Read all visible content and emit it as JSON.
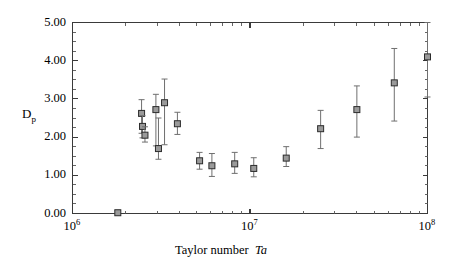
{
  "chart_data": {
    "type": "scatter",
    "title": "",
    "subtitle": "",
    "xlabel": "Taylor number Ta",
    "xlabel_plain": "Taylor number",
    "xlabel_italic": "Ta",
    "ylabel": "Dp",
    "ylabel_main": "D",
    "ylabel_sub": "p",
    "xscale": "log",
    "yscale": "linear",
    "xlim": [
      1000000,
      100000000
    ],
    "ylim": [
      0.0,
      5.0
    ],
    "grid": false,
    "legend": null,
    "legend_position": "none",
    "xticks_major": [
      1000000,
      10000000,
      100000000
    ],
    "xtick_labels": [
      "10⁶",
      "10⁷",
      "10⁸"
    ],
    "xtick_label_bases": [
      "10",
      "10",
      "10"
    ],
    "xtick_label_exponents": [
      "6",
      "7",
      "8"
    ],
    "yticks_major": [
      0.0,
      1.0,
      2.0,
      3.0,
      4.0,
      5.0
    ],
    "ytick_labels": [
      "0.00",
      "1.00",
      "2.00",
      "3.00",
      "4.00",
      "5.00"
    ],
    "ytick_minor_step": 0.25,
    "marker_style": "open-square",
    "marker_fill": "#9a9a9a",
    "marker_edge": "#2c2c2c",
    "errorbar_color": "#6f6f6f",
    "axis_color": "#3a3a3a",
    "series": [
      {
        "name": "Dp vs Taylor number",
        "points": [
          {
            "x": 1800000,
            "y": 0.02,
            "yerr_low": 0.02,
            "yerr_high": 0.06
          },
          {
            "x": 2450000,
            "y": 2.62,
            "yerr_low": 0.52,
            "yerr_high": 0.36
          },
          {
            "x": 2480000,
            "y": 2.28,
            "yerr_low": 0.3,
            "yerr_high": 0.28
          },
          {
            "x": 2560000,
            "y": 2.05,
            "yerr_low": 0.18,
            "yerr_high": 0.22
          },
          {
            "x": 2950000,
            "y": 2.72,
            "yerr_low": 0.95,
            "yerr_high": 0.4
          },
          {
            "x": 3050000,
            "y": 1.7,
            "yerr_low": 0.28,
            "yerr_high": 0.8
          },
          {
            "x": 3300000,
            "y": 2.9,
            "yerr_low": 1.1,
            "yerr_high": 0.62
          },
          {
            "x": 3900000,
            "y": 2.35,
            "yerr_low": 0.28,
            "yerr_high": 0.3
          },
          {
            "x": 5200000,
            "y": 1.38,
            "yerr_low": 0.22,
            "yerr_high": 0.22
          },
          {
            "x": 6100000,
            "y": 1.25,
            "yerr_low": 0.28,
            "yerr_high": 0.32
          },
          {
            "x": 8200000,
            "y": 1.3,
            "yerr_low": 0.25,
            "yerr_high": 0.3
          },
          {
            "x": 10500000,
            "y": 1.18,
            "yerr_low": 0.22,
            "yerr_high": 0.28
          },
          {
            "x": 16000000,
            "y": 1.45,
            "yerr_low": 0.22,
            "yerr_high": 0.3
          },
          {
            "x": 25000000,
            "y": 2.22,
            "yerr_low": 0.52,
            "yerr_high": 0.48
          },
          {
            "x": 40000000,
            "y": 2.72,
            "yerr_low": 0.72,
            "yerr_high": 0.62
          },
          {
            "x": 65000000,
            "y": 3.42,
            "yerr_low": 1.0,
            "yerr_high": 0.9
          },
          {
            "x": 100000000,
            "y": 4.1,
            "yerr_low": 1.05,
            "yerr_high": 0.95
          }
        ]
      }
    ]
  }
}
